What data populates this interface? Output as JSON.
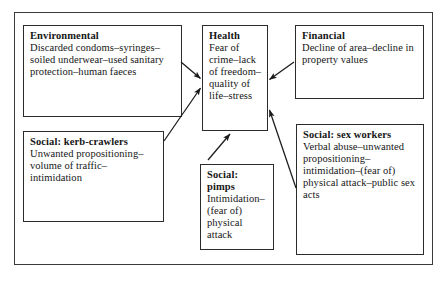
{
  "diagram": {
    "central_node": "health",
    "nodes": {
      "environmental": {
        "title": "Environmental",
        "body": "Discarded condoms–syringes–soiled underwear–used sanitary protection–human faeces"
      },
      "kerb_crawlers": {
        "title": "Social: kerb-crawlers",
        "body": "Unwanted propositioning–volume of traffic–intimidation"
      },
      "health": {
        "title": "Health",
        "body": "Fear of crime–lack of freedom–quality of life–stress"
      },
      "pimps": {
        "title": "Social: pimps",
        "body": "Intimidation–(fear of) physical attack"
      },
      "financial": {
        "title": "Financial",
        "body": "Decline of area–decline in property values"
      },
      "sex_workers": {
        "title": "Social: sex workers",
        "body": "Verbal abuse–unwanted propositioning–intimidation–(fear of) physical attack–public sex acts"
      }
    },
    "arrows": [
      {
        "from": "environmental",
        "to": "health",
        "direction": "right-down"
      },
      {
        "from": "kerb_crawlers",
        "to": "health",
        "direction": "right-up"
      },
      {
        "from": "financial",
        "to": "health",
        "direction": "left-down"
      },
      {
        "from": "sex_workers",
        "to": "health",
        "direction": "left-up"
      },
      {
        "from": "pimps",
        "to": "health",
        "direction": "up-right"
      }
    ],
    "colors": {
      "frame": "#3a3a3a",
      "box_border": "#2b2b2b",
      "text": "#161616",
      "arrow": "#1a1a1a",
      "background": "#ffffff"
    }
  }
}
